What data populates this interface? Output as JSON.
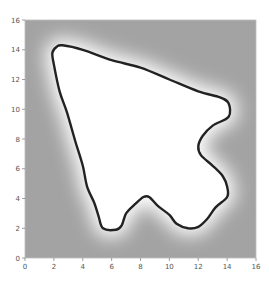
{
  "chart_data": {
    "type": "heatmap",
    "title": "",
    "xlabel": "",
    "ylabel": "",
    "xlim": [
      0,
      16
    ],
    "ylim": [
      0,
      16
    ],
    "grid": false,
    "legend": null,
    "x_ticks": [
      "0",
      "2",
      "4",
      "6",
      "8",
      "10",
      "12",
      "14",
      "16"
    ],
    "y_ticks": [
      "0",
      "2",
      "4",
      "6",
      "8",
      "10",
      "12",
      "14",
      "16"
    ],
    "background_color": "#a3a3a3",
    "interior_color": "#ffffff",
    "contour_color": "#222222",
    "contour": {
      "description": "Closed dark contour line of a shape resembling an arrow/cursor pointing up-left, with white interior and a soft white glow fading to gray outside",
      "points": [
        [
          2.6,
          14.3
        ],
        [
          4.0,
          14.0
        ],
        [
          6.0,
          13.3
        ],
        [
          8.0,
          12.8
        ],
        [
          10.0,
          12.0
        ],
        [
          12.0,
          11.2
        ],
        [
          13.5,
          10.8
        ],
        [
          14.1,
          10.4
        ],
        [
          14.1,
          9.5
        ],
        [
          13.0,
          8.9
        ],
        [
          12.3,
          8.2
        ],
        [
          12.0,
          7.5
        ],
        [
          12.2,
          6.9
        ],
        [
          13.0,
          6.2
        ],
        [
          13.7,
          5.5
        ],
        [
          14.0,
          4.8
        ],
        [
          14.0,
          4.1
        ],
        [
          13.2,
          3.4
        ],
        [
          12.6,
          2.6
        ],
        [
          12.0,
          2.1
        ],
        [
          11.3,
          2.0
        ],
        [
          10.5,
          2.3
        ],
        [
          10.0,
          2.9
        ],
        [
          9.2,
          3.5
        ],
        [
          8.6,
          4.1
        ],
        [
          8.2,
          4.1
        ],
        [
          7.6,
          3.6
        ],
        [
          7.0,
          3.0
        ],
        [
          6.7,
          2.2
        ],
        [
          6.3,
          1.9
        ],
        [
          5.4,
          2.0
        ],
        [
          5.1,
          2.8
        ],
        [
          4.8,
          3.7
        ],
        [
          4.3,
          4.8
        ],
        [
          4.0,
          6.2
        ],
        [
          3.5,
          7.8
        ],
        [
          2.9,
          9.8
        ],
        [
          2.4,
          11.2
        ],
        [
          2.0,
          13.0
        ],
        [
          1.9,
          13.8
        ],
        [
          2.2,
          14.2
        ]
      ]
    }
  }
}
